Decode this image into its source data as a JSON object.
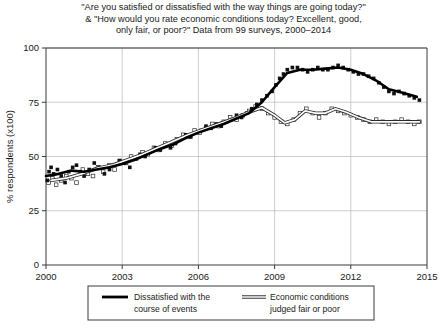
{
  "chart_data": {
    "type": "scatter",
    "title": "\"Are you satisfied or dissatisfied with the way things are going today?\" & \"How would you rate economic conditions today? Excellent, good, only fair, or poor?\" Data from 99 surveys, 2000–2014",
    "title_lines": [
      "\"Are you satisfied or dissatisfied with the way things are going today?\"",
      "& \"How would you rate economic conditions today? Excellent, good,",
      "only fair, or poor?\" Data from 99 surveys, 2000–2014"
    ],
    "xlabel": "",
    "ylabel": "% respondents (x100)",
    "xlim": [
      2000,
      2015
    ],
    "ylim": [
      0,
      100
    ],
    "xticks": [
      2000,
      2003,
      2006,
      2009,
      2012,
      2015
    ],
    "xtick_labels": [
      "2000",
      "2003",
      "2006",
      "2009",
      "2012",
      "2015"
    ],
    "yticks": [
      0,
      25,
      50,
      75,
      100
    ],
    "ytick_labels": [
      "0",
      "25",
      "50",
      "75",
      "100"
    ],
    "grid": true,
    "legend_position": "below-center",
    "series": [
      {
        "name": "Dissatisfied with the course of events",
        "legend_label_lines": [
          "Dissatisfied with the",
          "course of events"
        ],
        "marker": "filled-square",
        "line_style": "thick-solid",
        "color": "#000000",
        "points": [
          [
            2000.05,
            39
          ],
          [
            2000.12,
            43
          ],
          [
            2000.2,
            45
          ],
          [
            2000.3,
            42
          ],
          [
            2000.45,
            44
          ],
          [
            2000.6,
            41
          ],
          [
            2000.75,
            38
          ],
          [
            2000.9,
            43
          ],
          [
            2001.05,
            45
          ],
          [
            2001.2,
            46
          ],
          [
            2001.35,
            43
          ],
          [
            2001.5,
            41
          ],
          [
            2001.7,
            44
          ],
          [
            2001.9,
            47
          ],
          [
            2002.1,
            45
          ],
          [
            2002.3,
            42
          ],
          [
            2002.5,
            44
          ],
          [
            2002.7,
            46
          ],
          [
            2002.9,
            48
          ],
          [
            2003.1,
            47
          ],
          [
            2003.3,
            45
          ],
          [
            2003.5,
            49
          ],
          [
            2003.7,
            51
          ],
          [
            2003.9,
            50
          ],
          [
            2004.1,
            52
          ],
          [
            2004.3,
            54
          ],
          [
            2004.5,
            53
          ],
          [
            2004.7,
            55
          ],
          [
            2004.9,
            54
          ],
          [
            2005.1,
            56
          ],
          [
            2005.3,
            58
          ],
          [
            2005.5,
            60
          ],
          [
            2005.7,
            59
          ],
          [
            2005.9,
            61
          ],
          [
            2006.1,
            62
          ],
          [
            2006.3,
            64
          ],
          [
            2006.5,
            63
          ],
          [
            2006.7,
            65
          ],
          [
            2006.9,
            64
          ],
          [
            2007.1,
            66
          ],
          [
            2007.3,
            67
          ],
          [
            2007.5,
            69
          ],
          [
            2007.7,
            68
          ],
          [
            2007.9,
            70
          ],
          [
            2008.1,
            72
          ],
          [
            2008.3,
            74
          ],
          [
            2008.5,
            76
          ],
          [
            2008.7,
            78
          ],
          [
            2008.9,
            80
          ],
          [
            2009.05,
            83
          ],
          [
            2009.2,
            86
          ],
          [
            2009.35,
            88
          ],
          [
            2009.5,
            90
          ],
          [
            2009.7,
            91
          ],
          [
            2009.9,
            91
          ],
          [
            2010.1,
            90
          ],
          [
            2010.3,
            89
          ],
          [
            2010.5,
            90
          ],
          [
            2010.7,
            91
          ],
          [
            2010.9,
            90
          ],
          [
            2011.1,
            90
          ],
          [
            2011.3,
            91
          ],
          [
            2011.5,
            92
          ],
          [
            2011.7,
            91
          ],
          [
            2011.9,
            90
          ],
          [
            2012.1,
            89
          ],
          [
            2012.3,
            88
          ],
          [
            2012.5,
            88
          ],
          [
            2012.7,
            87
          ],
          [
            2012.9,
            86
          ],
          [
            2013.1,
            84
          ],
          [
            2013.3,
            82
          ],
          [
            2013.5,
            80
          ],
          [
            2013.7,
            79
          ],
          [
            2013.9,
            80
          ],
          [
            2014.1,
            79
          ],
          [
            2014.3,
            78
          ],
          [
            2014.5,
            77
          ],
          [
            2014.7,
            76
          ]
        ],
        "trend": [
          [
            2000.0,
            41
          ],
          [
            2000.5,
            42
          ],
          [
            2001.0,
            43.5
          ],
          [
            2001.5,
            43
          ],
          [
            2002.0,
            44
          ],
          [
            2002.5,
            45
          ],
          [
            2003.0,
            46.5
          ],
          [
            2003.5,
            48.5
          ],
          [
            2004.0,
            51
          ],
          [
            2004.5,
            53.5
          ],
          [
            2005.0,
            55.5
          ],
          [
            2005.5,
            58.5
          ],
          [
            2006.0,
            61
          ],
          [
            2006.5,
            63
          ],
          [
            2007.0,
            65
          ],
          [
            2007.5,
            67.5
          ],
          [
            2008.0,
            70
          ],
          [
            2008.5,
            75
          ],
          [
            2009.0,
            82
          ],
          [
            2009.5,
            88.5
          ],
          [
            2010.0,
            90
          ],
          [
            2010.5,
            90
          ],
          [
            2011.0,
            90.5
          ],
          [
            2011.5,
            91
          ],
          [
            2012.0,
            90
          ],
          [
            2012.5,
            88
          ],
          [
            2013.0,
            85
          ],
          [
            2013.5,
            81
          ],
          [
            2014.0,
            79.5
          ],
          [
            2014.6,
            77.5
          ]
        ]
      },
      {
        "name": "Economic conditions judged fair or poor",
        "legend_label_lines": [
          "Economic conditions",
          "judged fair or poor"
        ],
        "marker": "open-square",
        "line_style": "double-thin",
        "color": "#333333",
        "points": [
          [
            2000.1,
            38
          ],
          [
            2000.25,
            40
          ],
          [
            2000.4,
            37
          ],
          [
            2000.6,
            39
          ],
          [
            2000.8,
            41
          ],
          [
            2001.0,
            40
          ],
          [
            2001.2,
            38
          ],
          [
            2001.45,
            44
          ],
          [
            2001.65,
            42
          ],
          [
            2001.85,
            41
          ],
          [
            2002.05,
            45
          ],
          [
            2002.25,
            43
          ],
          [
            2002.5,
            46
          ],
          [
            2002.7,
            44
          ],
          [
            2002.9,
            48
          ],
          [
            2003.15,
            47
          ],
          [
            2003.35,
            50
          ],
          [
            2003.55,
            49
          ],
          [
            2003.8,
            52
          ],
          [
            2004.0,
            51
          ],
          [
            2004.25,
            54
          ],
          [
            2004.45,
            53
          ],
          [
            2004.7,
            56
          ],
          [
            2004.95,
            55
          ],
          [
            2005.15,
            58
          ],
          [
            2005.4,
            60
          ],
          [
            2005.6,
            59
          ],
          [
            2005.85,
            62
          ],
          [
            2006.05,
            61
          ],
          [
            2006.3,
            63
          ],
          [
            2006.55,
            65
          ],
          [
            2006.8,
            64
          ],
          [
            2007.0,
            66
          ],
          [
            2007.25,
            68
          ],
          [
            2007.5,
            67
          ],
          [
            2007.75,
            69
          ],
          [
            2008.0,
            71
          ],
          [
            2008.25,
            73
          ],
          [
            2008.5,
            72
          ],
          [
            2008.75,
            70
          ],
          [
            2009.0,
            68
          ],
          [
            2009.25,
            66
          ],
          [
            2009.5,
            65
          ],
          [
            2009.75,
            67
          ],
          [
            2010.0,
            70
          ],
          [
            2010.25,
            72
          ],
          [
            2010.5,
            70
          ],
          [
            2010.75,
            68
          ],
          [
            2011.0,
            70
          ],
          [
            2011.25,
            72
          ],
          [
            2011.5,
            71
          ],
          [
            2011.75,
            70
          ],
          [
            2012.0,
            69
          ],
          [
            2012.25,
            68
          ],
          [
            2012.5,
            67
          ],
          [
            2012.75,
            66
          ],
          [
            2013.0,
            67
          ],
          [
            2013.25,
            66
          ],
          [
            2013.5,
            65
          ],
          [
            2013.75,
            66
          ],
          [
            2014.0,
            67
          ],
          [
            2014.25,
            66
          ],
          [
            2014.5,
            65
          ],
          [
            2014.7,
            66
          ]
        ],
        "trend": [
          [
            2000.2,
            39
          ],
          [
            2000.8,
            40
          ],
          [
            2001.4,
            42
          ],
          [
            2002.0,
            44.5
          ],
          [
            2002.6,
            46
          ],
          [
            2003.2,
            48.5
          ],
          [
            2003.8,
            51
          ],
          [
            2004.4,
            54
          ],
          [
            2005.0,
            57
          ],
          [
            2005.6,
            60
          ],
          [
            2006.2,
            62.5
          ],
          [
            2006.8,
            65
          ],
          [
            2007.4,
            67.5
          ],
          [
            2008.0,
            70.5
          ],
          [
            2008.5,
            72.5
          ],
          [
            2009.0,
            69
          ],
          [
            2009.4,
            65.5
          ],
          [
            2009.8,
            67
          ],
          [
            2010.2,
            71
          ],
          [
            2010.6,
            70
          ],
          [
            2011.0,
            70
          ],
          [
            2011.4,
            72
          ],
          [
            2011.8,
            70.5
          ],
          [
            2012.3,
            68
          ],
          [
            2012.8,
            66
          ],
          [
            2013.3,
            66
          ],
          [
            2013.8,
            66
          ],
          [
            2014.3,
            66
          ],
          [
            2014.7,
            66
          ]
        ]
      }
    ]
  }
}
